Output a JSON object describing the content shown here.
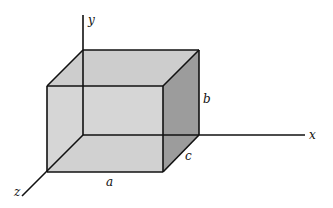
{
  "diagram": {
    "type": "3d-box-on-axes",
    "axes": {
      "x": "x",
      "y": "y",
      "z": "z"
    },
    "dimensions": {
      "a": "a",
      "b": "b",
      "c": "c"
    },
    "colors": {
      "line": "#111111",
      "front_face": "#d4d4d4",
      "top_face": "#cfcfcf",
      "side_face": "#9a9a9a",
      "bottom_face": "#c8c8c8"
    }
  }
}
